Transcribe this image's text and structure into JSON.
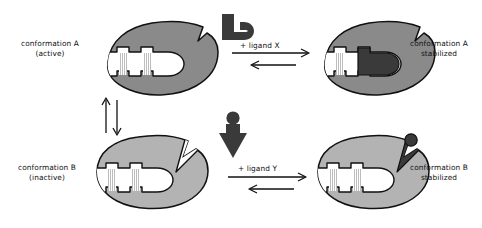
{
  "diagram": {
    "type": "biochemistry-mechanism-diagram",
    "background_color": "#ffffff",
    "outline_color": "#111111",
    "protein_a_color": "#8a8a8a",
    "protein_b_color": "#b3b3b3",
    "ligand_color": "#3a3a3a",
    "cleft_color": "#ffffff",
    "hatch_color": "#b9b9b9"
  },
  "labels": {
    "conformation_a": "conformation A\n(active)",
    "conformation_a_stabilized": "conformation A\nstabilized",
    "conformation_b": "conformation B\n(inactive)",
    "conformation_b_stabilized": "conformation B\nstabilized",
    "ligand_x": "+ ligand X",
    "ligand_y": "+ ligand Y"
  },
  "nodes": [
    {
      "id": "protein-a-free",
      "label": "conformation A\n(active)",
      "state": "active",
      "fill": "#8a8a8a",
      "ligand_bound": false,
      "row": "top",
      "column": "left"
    },
    {
      "id": "protein-a-bound",
      "label": "conformation A\nstabilized",
      "state": "active-stabilized",
      "fill": "#8a8a8a",
      "ligand_bound": true,
      "ligand": "X",
      "row": "top",
      "column": "right"
    },
    {
      "id": "protein-b-free",
      "label": "conformation B\n(inactive)",
      "state": "inactive",
      "fill": "#b3b3b3",
      "ligand_bound": false,
      "row": "bottom",
      "column": "left"
    },
    {
      "id": "protein-b-bound",
      "label": "conformation B\nstabilized",
      "state": "inactive-stabilized",
      "fill": "#b3b3b3",
      "ligand_bound": true,
      "ligand": "Y",
      "row": "bottom",
      "column": "right"
    }
  ],
  "ligands": [
    {
      "id": "ligand-x",
      "name": "ligand X",
      "shape": "hook",
      "fill": "#3a3a3a"
    },
    {
      "id": "ligand-y",
      "name": "ligand Y",
      "shape": "arrowhead-with-knob",
      "fill": "#3a3a3a"
    }
  ],
  "arrows": [
    {
      "id": "equilibrium-a-b",
      "orientation": "vertical",
      "reversible": true,
      "label": ""
    },
    {
      "id": "binding-x",
      "orientation": "horizontal",
      "reversible": true,
      "label": "+ ligand X"
    },
    {
      "id": "binding-y",
      "orientation": "horizontal",
      "reversible": true,
      "label": "+ ligand Y"
    }
  ]
}
